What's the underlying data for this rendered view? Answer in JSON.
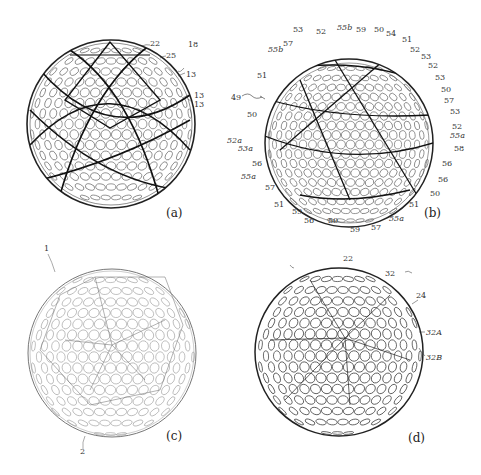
{
  "figure": {
    "panels": [
      {
        "id": "a",
        "caption": "(a)",
        "reference_numerals": [
          "22",
          "25",
          "18",
          "13",
          "13",
          "13"
        ],
        "dimple_labels": [
          "58",
          "59",
          "60"
        ]
      },
      {
        "id": "b",
        "caption": "(b)",
        "reference_numerals": [
          "53",
          "52",
          "55b",
          "59",
          "50",
          "54",
          "51",
          "57",
          "55b",
          "52",
          "53",
          "52",
          "53",
          "51",
          "50",
          "49",
          "57",
          "50",
          "53",
          "52a",
          "52",
          "55a",
          "53a",
          "58",
          "56",
          "56",
          "55a",
          "56",
          "57",
          "50",
          "51",
          "51",
          "59",
          "56",
          "50",
          "59",
          "57",
          "55a"
        ]
      },
      {
        "id": "c",
        "caption": "(c)",
        "reference_numerals": [
          "1",
          "2"
        ],
        "dimple_labels": [
          "C",
          "B",
          "A"
        ]
      },
      {
        "id": "d",
        "caption": "(d)",
        "reference_numerals": [
          "22",
          "32",
          "24",
          "32A",
          "32B"
        ]
      }
    ]
  },
  "labels": {
    "a": {
      "n22": "22",
      "n25": "25",
      "n18": "18",
      "n13a": "13",
      "n13b": "13",
      "n13c": "13",
      "cap": "(a)"
    },
    "b": {
      "n53t": "53",
      "n52t": "52",
      "n55bt": "55b",
      "n59t": "59",
      "n50t": "50",
      "n54": "54",
      "n51t": "51",
      "n57t": "57",
      "n55bl": "55b",
      "n52r1": "52",
      "n53r1": "53",
      "n52r2": "52",
      "n53r2": "53",
      "n51l": "51",
      "n50r": "50",
      "n49": "49",
      "n57r": "57",
      "n50l": "50",
      "n53r3": "53",
      "n52a": "52a",
      "n52r3": "52",
      "n55ar": "55a",
      "n53a": "53a",
      "n58": "58",
      "n56l": "56",
      "n56r1": "56",
      "n55al": "55a",
      "n56r2": "56",
      "n57l": "57",
      "n50br": "50",
      "n51bl": "51",
      "n51br": "51",
      "n59b1": "59",
      "n56b": "56",
      "n50b": "50",
      "n59b2": "59",
      "n57b": "57",
      "n55ab": "55a",
      "cap": "(b)"
    },
    "c": {
      "n1": "1",
      "n2": "2",
      "cap": "(c)"
    },
    "d": {
      "n22": "22",
      "n32": "32",
      "n24": "24",
      "n32A": "32A",
      "n32B": "32B",
      "cap": "(d)"
    }
  }
}
